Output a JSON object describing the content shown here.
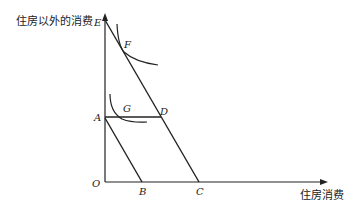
{
  "diagram": {
    "y_axis_label": "住房以外的消费",
    "x_axis_label": "住房消费",
    "points": {
      "origin": "O",
      "E": "E",
      "F": "F",
      "A": "A",
      "G": "G",
      "D": "D",
      "B": "B",
      "C": "C"
    },
    "lines": [
      {
        "name": "budget-line-EC",
        "from": "E",
        "to": "C"
      },
      {
        "name": "budget-line-AB",
        "from": "A",
        "to": "B"
      },
      {
        "name": "segment-AD",
        "from": "A",
        "to": "D"
      }
    ],
    "curves": [
      {
        "name": "indifference-curve-upper",
        "tangent_at": "F"
      },
      {
        "name": "indifference-curve-lower",
        "tangent_at": "G"
      }
    ]
  }
}
